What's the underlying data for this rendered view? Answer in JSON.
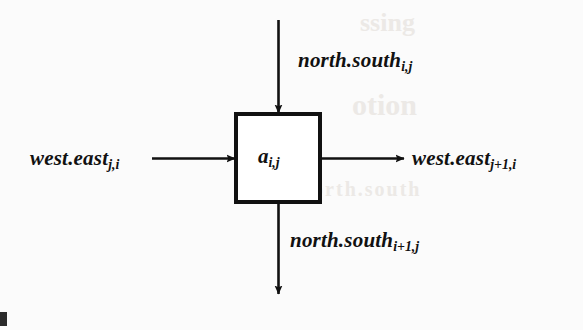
{
  "figure": {
    "type": "dataflow-cell-diagram",
    "background_color": "#fbfbfb",
    "ink_color": "#111111",
    "cell": {
      "name": "processing-cell",
      "label_base": "a",
      "label_subscript": "i,j",
      "box": {
        "x": 236,
        "y": 114,
        "width": 84,
        "height": 88,
        "stroke_width": 4
      }
    },
    "signals": [
      {
        "id": "north-south-in",
        "base": "north.south",
        "subscript": "i,j",
        "direction": "down",
        "role": "input",
        "side": "top"
      },
      {
        "id": "north-south-out",
        "base": "north.south",
        "subscript": "i+1,j",
        "direction": "down",
        "role": "output",
        "side": "bottom"
      },
      {
        "id": "west-east-in",
        "base": "west.east",
        "subscript": "j,i",
        "direction": "right",
        "role": "input",
        "side": "left"
      },
      {
        "id": "west-east-out",
        "base": "west.east",
        "subscript": "j+1,i",
        "direction": "right",
        "role": "output",
        "side": "right"
      }
    ],
    "ghost_text": {
      "line1": "ssing",
      "line2": "otion",
      "line3": "north.south"
    }
  }
}
